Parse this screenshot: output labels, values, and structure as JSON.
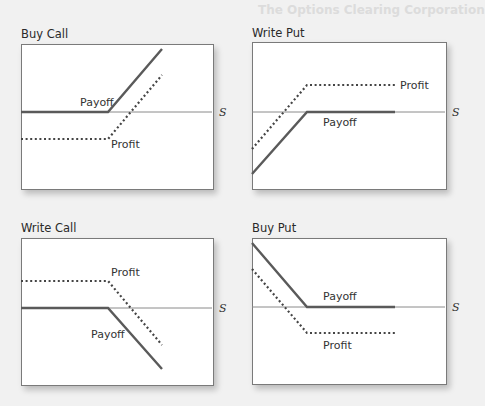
{
  "background_text": {
    "heading": "The Options Clearing Corporation"
  },
  "axis_label": "S",
  "colors": {
    "payoff_line": "#5a5a5a",
    "profit_line": "#444444",
    "axis_line": "#8a8a8a"
  },
  "panels": [
    {
      "title": "Buy Call",
      "payoff_label": "Payoff",
      "profit_label": "Profit"
    },
    {
      "title": "Write Put",
      "payoff_label": "Payoff",
      "profit_label": "Profit"
    },
    {
      "title": "Write Call",
      "payoff_label": "Payoff",
      "profit_label": "Profit"
    },
    {
      "title": "Buy Put",
      "payoff_label": "Payoff",
      "profit_label": "Profit"
    }
  ]
}
